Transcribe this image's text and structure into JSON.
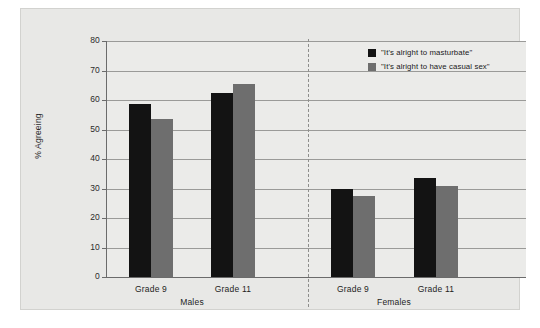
{
  "chart_data": {
    "type": "bar",
    "title": "",
    "subtitle": "",
    "xlabel": "",
    "ylabel": "% Agreeing",
    "ylim": [
      0,
      80
    ],
    "yticks": [
      0,
      10,
      20,
      30,
      40,
      50,
      60,
      70,
      80
    ],
    "ytick_labels": [
      "0",
      "10",
      "20",
      "30",
      "40",
      "50",
      "60",
      "70",
      "80"
    ],
    "grid": "horizontal",
    "legend_position": "top-right",
    "groups": [
      "Males",
      "Females"
    ],
    "categories": [
      "Grade 9",
      "Grade 11",
      "Grade 9",
      "Grade 11"
    ],
    "category_groups": [
      "Males",
      "Males",
      "Females",
      "Females"
    ],
    "series": [
      {
        "name": "\"It's alright to masturbate\"",
        "color": "#131313",
        "values": [
          58.5,
          62.5,
          30.0,
          33.5
        ]
      },
      {
        "name": "\"It's alright to have casual sex\"",
        "color": "#6e6e6e",
        "values": [
          53.5,
          65.5,
          27.5,
          31.0
        ]
      }
    ],
    "annotations": [
      "dashed vertical divider separating Males and Females"
    ]
  },
  "axis": {
    "y_title": "% Agreeing",
    "ticks": [
      "80",
      "70",
      "60",
      "50",
      "40",
      "30",
      "20",
      "10",
      "0"
    ]
  },
  "legend": {
    "items": [
      {
        "label": "\"It's alright to masturbate\"",
        "swatch": "dark"
      },
      {
        "label": "\"It's alright to have casual sex\"",
        "swatch": "light"
      }
    ]
  },
  "labels": {
    "males_grade9": "Grade 9",
    "males_grade11": "Grade 11",
    "females_grade9": "Grade 9",
    "females_grade11": "Grade 11",
    "group_males": "Males",
    "group_females": "Females"
  },
  "colors": {
    "series_dark": "#131313",
    "series_light": "#6e6e6e",
    "panel_background": "#e8e8e6",
    "plot_background": "#ebebe9",
    "gridline": "#9a9a98",
    "axis": "#6b6b6b"
  }
}
